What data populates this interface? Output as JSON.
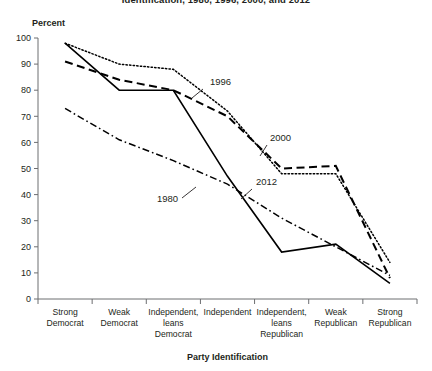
{
  "chart_data": {
    "type": "line",
    "title": "Identification, 1980, 1996, 2000, and 2012",
    "xlabel": "Party Identification",
    "ylabel": "Percent",
    "ylim": [
      0,
      100
    ],
    "yticks": [
      0,
      10,
      20,
      30,
      40,
      50,
      60,
      70,
      80,
      90,
      100
    ],
    "grid": false,
    "legend_position": "inline-annotations",
    "categories": [
      "Strong Democrat",
      "Weak Democrat",
      "Independent, leans Democrat",
      "Independent",
      "Independent, leans Republican",
      "Weak Republican",
      "Strong Republican"
    ],
    "category_lines": [
      [
        "Strong",
        "Democrat"
      ],
      [
        "Weak",
        "Democrat"
      ],
      [
        "Independent,",
        "leans",
        "Democrat"
      ],
      [
        "Independent"
      ],
      [
        "Independent,",
        "leans",
        "Republican"
      ],
      [
        "Weak",
        "Republican"
      ],
      [
        "Strong",
        "Republican"
      ]
    ],
    "series": [
      {
        "name": "1980",
        "style": "dash-dot",
        "values": [
          73,
          61,
          53,
          44,
          31,
          20,
          9
        ]
      },
      {
        "name": "1996",
        "style": "dotted",
        "values": [
          98,
          90,
          88,
          72,
          48,
          48,
          14
        ]
      },
      {
        "name": "2000",
        "style": "dashed",
        "values": [
          91,
          84,
          80,
          70,
          50,
          51,
          8
        ]
      },
      {
        "name": "2012",
        "style": "solid",
        "values": [
          98,
          80,
          80,
          47,
          18,
          21,
          6
        ]
      }
    ],
    "annotations": [
      {
        "label": "1980",
        "x": 157,
        "y": 202,
        "leader": [
          182,
          198,
          196,
          187
        ]
      },
      {
        "label": "1996",
        "x": 210,
        "y": 85,
        "leader": [
          203,
          89,
          192,
          98
        ]
      },
      {
        "label": "2000",
        "x": 270,
        "y": 141,
        "leader": [
          267,
          145,
          260,
          156
        ]
      },
      {
        "label": "2012",
        "x": 256,
        "y": 185,
        "leader": [
          252,
          189,
          241,
          199
        ]
      }
    ]
  }
}
